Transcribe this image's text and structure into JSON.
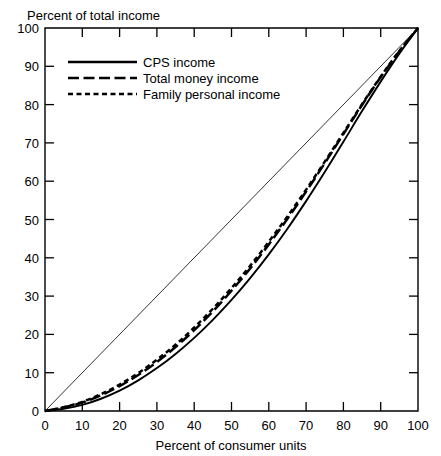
{
  "chart_data": {
    "type": "line",
    "title": "",
    "xlabel": "Percent of consumer units",
    "ylabel": "Percent of total income",
    "xlim": [
      0,
      100
    ],
    "ylim": [
      0,
      100
    ],
    "grid": false,
    "legend_position": "top-left-inside",
    "xticks": [
      0,
      10,
      20,
      30,
      40,
      50,
      60,
      70,
      80,
      90,
      100
    ],
    "yticks": [
      0,
      10,
      20,
      30,
      40,
      50,
      60,
      70,
      80,
      90,
      100
    ],
    "xtick_labels": [
      "0",
      "10",
      "20",
      "30",
      "40",
      "50",
      "60",
      "70",
      "80",
      "90",
      "100"
    ],
    "ytick_labels": [
      "0",
      "10",
      "20",
      "30",
      "40",
      "50",
      "60",
      "70",
      "80",
      "90",
      "100"
    ],
    "reference_line": {
      "name": "line of equality",
      "x": [
        0,
        100
      ],
      "y": [
        0,
        100
      ],
      "style": "thin-solid"
    },
    "x": [
      0,
      5,
      10,
      15,
      20,
      25,
      30,
      35,
      40,
      45,
      50,
      55,
      60,
      65,
      70,
      75,
      80,
      85,
      90,
      95,
      100
    ],
    "series": [
      {
        "name": "CPS income",
        "style": "solid",
        "values": [
          0.0,
          0.6,
          1.6,
          3.2,
          5.3,
          8.0,
          11.2,
          14.9,
          19.1,
          23.8,
          29.0,
          34.7,
          40.9,
          47.6,
          54.8,
          62.4,
          70.3,
          78.3,
          86.0,
          93.3,
          100.0
        ]
      },
      {
        "name": "Total money income",
        "style": "long-dash",
        "values": [
          0.0,
          0.9,
          2.2,
          4.1,
          6.5,
          9.4,
          12.8,
          16.7,
          21.1,
          26.0,
          31.4,
          37.2,
          43.5,
          50.2,
          57.3,
          64.7,
          72.3,
          79.9,
          87.2,
          93.9,
          100.0
        ]
      },
      {
        "name": "Family personal income",
        "style": "short-dash",
        "values": [
          0.0,
          1.0,
          2.4,
          4.4,
          6.9,
          9.9,
          13.4,
          17.3,
          21.8,
          26.7,
          32.1,
          37.9,
          44.2,
          50.8,
          57.8,
          65.1,
          72.6,
          80.1,
          87.3,
          94.0,
          100.0
        ]
      }
    ],
    "legend": [
      {
        "label": "CPS income",
        "style": "solid"
      },
      {
        "label": "Total money income",
        "style": "long-dash"
      },
      {
        "label": "Family personal income",
        "style": "short-dash"
      }
    ]
  },
  "colors": {
    "ink": "#000000",
    "background": "#ffffff"
  }
}
